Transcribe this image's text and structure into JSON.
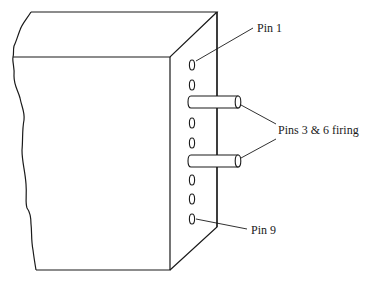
{
  "diagram": {
    "labels": {
      "pin1": "Pin 1",
      "pins_firing": "Pins 3 & 6 firing",
      "pin9": "Pin 9"
    },
    "pin_count": 9,
    "firing_pins": [
      3,
      6
    ],
    "colors": {
      "stroke": "#1a1a1a",
      "background": "#ffffff"
    }
  }
}
